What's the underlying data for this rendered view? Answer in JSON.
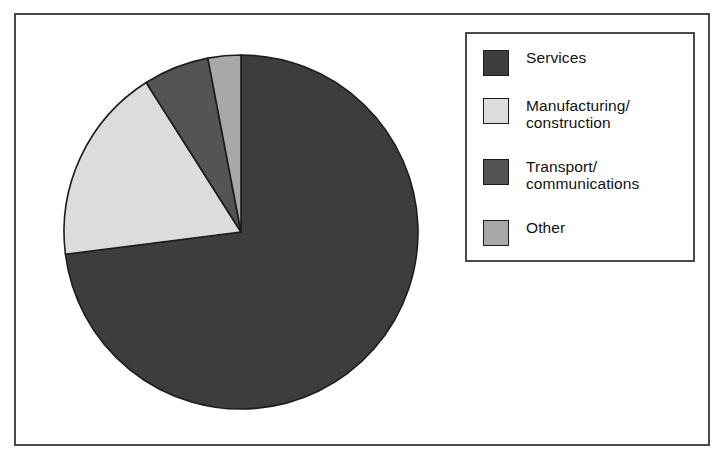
{
  "figure": {
    "background_color": "#ffffff",
    "frame_color": "#4a4a4a"
  },
  "chart_data": {
    "type": "pie",
    "title": "",
    "subtitle": "",
    "xlabel": "",
    "ylabel": "",
    "grid": false,
    "legend_position": "right",
    "start_angle_deg": 90,
    "direction": "clockwise",
    "center": {
      "x": 241,
      "y": 232
    },
    "radius": 177,
    "categories": [
      "Services",
      "Manufacturing/construction",
      "Transport/communications",
      "Other"
    ],
    "values": [
      73,
      18,
      6,
      3
    ],
    "units": "percent",
    "slice_colors": [
      "#3d3d3d",
      "#dcdcdc",
      "#545454",
      "#a8a8a8"
    ],
    "slice_edge_color": "#1c1c1c",
    "slices": [
      {
        "label": "Services",
        "value": 73,
        "color": "#3d3d3d"
      },
      {
        "label": "Manufacturing/construction",
        "value": 18,
        "color": "#dcdcdc"
      },
      {
        "label": "Transport/communications",
        "value": 6,
        "color": "#545454"
      },
      {
        "label": "Other",
        "value": 3,
        "color": "#a8a8a8"
      }
    ]
  },
  "legend": {
    "items": [
      {
        "label": "Services",
        "color": "#3d3d3d",
        "swatch_name": "legend-swatch-services"
      },
      {
        "label": "Manufacturing/\nconstruction",
        "color": "#dcdcdc",
        "swatch_name": "legend-swatch-manufacturing-construction"
      },
      {
        "label": "Transport/\ncommunications",
        "color": "#545454",
        "swatch_name": "legend-swatch-transport-communications"
      },
      {
        "label": "Other",
        "color": "#a8a8a8",
        "swatch_name": "legend-swatch-other"
      }
    ]
  }
}
